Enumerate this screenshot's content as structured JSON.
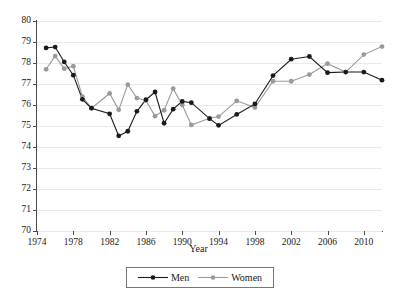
{
  "chart_data": {
    "type": "line",
    "title": "",
    "xlabel": "Year",
    "ylabel": "",
    "xlim": [
      1974,
      2012
    ],
    "ylim": [
      70,
      80
    ],
    "grid": true,
    "legend_position": "bottom",
    "xticks": [
      1974,
      1978,
      1982,
      1986,
      1990,
      1994,
      1998,
      2002,
      2006,
      2010
    ],
    "yticks": [
      70,
      71,
      72,
      73,
      74,
      75,
      76,
      77,
      78,
      79,
      80
    ],
    "x": [
      1975,
      1976,
      1977,
      1978,
      1979,
      1980,
      1981,
      1982,
      1983,
      1984,
      1985,
      1986,
      1987,
      1988,
      1989,
      1990,
      1991,
      1992,
      1993,
      1994,
      1995,
      1996,
      1997,
      1998,
      1999,
      2000,
      2001,
      2002,
      2003,
      2004,
      2005,
      2006,
      2007,
      2008,
      2009,
      2010,
      2011,
      2012
    ],
    "series": [
      {
        "name": "Men",
        "color": "#1a1a1a",
        "marker": "circle",
        "values": [
          78.72,
          78.76,
          78.05,
          77.42,
          76.27,
          75.85,
          75.58,
          74.53,
          74.75,
          75.7,
          76.25,
          76.62,
          75.13,
          75.8,
          76.17,
          76.11,
          75.72,
          75.35,
          75.03,
          75.55,
          76.05,
          77.4,
          78.18,
          78.31,
          77.54,
          77.57,
          77.57,
          77.18,
          77.18,
          77.18,
          77.18,
          77.18,
          77.18,
          77.18,
          77.18,
          77.18,
          77.18,
          77.18
        ]
      },
      {
        "name": "Women",
        "color": "#9a9a9a",
        "marker": "circle",
        "values": [
          77.7,
          78.33,
          77.73,
          77.85,
          76.4,
          75.85,
          76.55,
          75.77,
          76.97,
          76.33,
          76.22,
          75.47,
          75.75,
          76.78,
          76.0,
          75.05,
          75.25,
          75.37,
          75.45,
          76.2,
          75.88,
          77.13,
          77.13,
          77.45,
          77.97,
          77.57,
          78.4,
          78.78,
          78.78,
          78.78,
          78.78,
          78.78,
          78.78,
          78.78,
          78.78,
          78.78,
          78.78,
          78.78
        ]
      }
    ],
    "series_x": {
      "Men": [
        1975,
        1976,
        1977,
        1978,
        1979,
        1980,
        1981,
        1982,
        1983,
        1984,
        1985,
        1986,
        1987,
        1988,
        1989,
        1990,
        1991,
        1993,
        1994,
        1996,
        1998,
        2000,
        2002,
        2004,
        2006,
        2008,
        2010,
        2012
      ],
      "Women": [
        1975,
        1976,
        1977,
        1978,
        1979,
        1980,
        1981,
        1982,
        1983,
        1984,
        1985,
        1986,
        1987,
        1988,
        1989,
        1990,
        1991,
        1993,
        1994,
        1996,
        1998,
        2000,
        2002,
        2004,
        2006,
        2008,
        2010,
        2012
      ]
    },
    "points_men": [
      [
        1975,
        78.72
      ],
      [
        1976,
        78.76
      ],
      [
        1977,
        78.05
      ],
      [
        1978,
        77.42
      ],
      [
        1979,
        76.27
      ],
      [
        1980,
        75.85
      ],
      [
        1982,
        75.58
      ],
      [
        1983,
        74.53
      ],
      [
        1984,
        74.75
      ],
      [
        1985,
        75.7
      ],
      [
        1986,
        76.25
      ],
      [
        1987,
        76.62
      ],
      [
        1988,
        75.13
      ],
      [
        1989,
        75.8
      ],
      [
        1990,
        76.17
      ],
      [
        1991,
        76.11
      ],
      [
        1993,
        75.35
      ],
      [
        1994,
        75.03
      ],
      [
        1996,
        75.55
      ],
      [
        1998,
        76.05
      ],
      [
        2000,
        77.4
      ],
      [
        2002,
        78.18
      ],
      [
        2004,
        78.31
      ],
      [
        2006,
        77.54
      ],
      [
        2008,
        77.57
      ],
      [
        2010,
        77.57
      ],
      [
        2012,
        77.18
      ]
    ],
    "points_women": [
      [
        1975,
        77.7
      ],
      [
        1976,
        78.33
      ],
      [
        1977,
        77.73
      ],
      [
        1978,
        77.85
      ],
      [
        1979,
        76.4
      ],
      [
        1980,
        75.85
      ],
      [
        1982,
        76.55
      ],
      [
        1983,
        75.77
      ],
      [
        1984,
        76.97
      ],
      [
        1985,
        76.33
      ],
      [
        1986,
        76.22
      ],
      [
        1987,
        75.47
      ],
      [
        1988,
        75.75
      ],
      [
        1989,
        76.78
      ],
      [
        1990,
        76.0
      ],
      [
        1991,
        75.05
      ],
      [
        1993,
        75.37
      ],
      [
        1994,
        75.45
      ],
      [
        1996,
        76.2
      ],
      [
        1998,
        75.88
      ],
      [
        2000,
        77.13
      ],
      [
        2002,
        77.13
      ],
      [
        2004,
        77.45
      ],
      [
        2006,
        77.97
      ],
      [
        2008,
        77.57
      ],
      [
        2010,
        78.4
      ],
      [
        2012,
        78.78
      ]
    ]
  },
  "legend": {
    "men_label": "Men",
    "women_label": "Women"
  }
}
